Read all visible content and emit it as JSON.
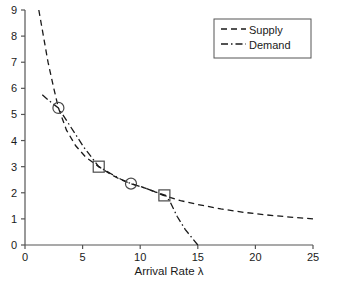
{
  "chart_data": {
    "type": "line",
    "title": "",
    "xlabel": "Arrival Rate λ",
    "ylabel": "",
    "xlim": [
      0,
      25
    ],
    "ylim": [
      0,
      9
    ],
    "xticks": [
      0,
      5,
      10,
      15,
      20,
      25
    ],
    "yticks": [
      0,
      1,
      2,
      3,
      4,
      5,
      6,
      7,
      8,
      9
    ],
    "xtick_labels": [
      "0",
      "5",
      "10",
      "15",
      "20",
      "25"
    ],
    "ytick_labels": [
      "0",
      "1",
      "2",
      "3",
      "4",
      "5",
      "6",
      "7",
      "8",
      "9"
    ],
    "grid": false,
    "legend_position": "upper right",
    "series": [
      {
        "name": "Supply",
        "style": "dashed",
        "color": "#1a1a1a",
        "points": [
          [
            1.2,
            9.0
          ],
          [
            1.6,
            8.0
          ],
          [
            2.0,
            7.0
          ],
          [
            2.5,
            6.0
          ],
          [
            2.9,
            5.25
          ],
          [
            3.6,
            4.4
          ],
          [
            4.4,
            3.8
          ],
          [
            5.3,
            3.35
          ],
          [
            6.4,
            3.0
          ],
          [
            7.4,
            2.72
          ],
          [
            8.3,
            2.5
          ],
          [
            9.2,
            2.35
          ],
          [
            10.3,
            2.2
          ],
          [
            11.2,
            2.05
          ],
          [
            12.0,
            1.9
          ],
          [
            13.5,
            1.7
          ],
          [
            15.0,
            1.55
          ],
          [
            17.0,
            1.38
          ],
          [
            19.0,
            1.25
          ],
          [
            21.0,
            1.15
          ],
          [
            23.0,
            1.07
          ],
          [
            25.0,
            1.0
          ]
        ]
      },
      {
        "name": "Demand",
        "style": "dashdot",
        "color": "#1a1a1a",
        "points": [
          [
            1.5,
            5.75
          ],
          [
            2.3,
            5.45
          ],
          [
            2.9,
            5.25
          ],
          [
            4.0,
            4.5
          ],
          [
            5.1,
            3.75
          ],
          [
            6.4,
            3.0
          ],
          [
            7.5,
            2.72
          ],
          [
            8.4,
            2.5
          ],
          [
            9.2,
            2.35
          ],
          [
            10.3,
            2.2
          ],
          [
            11.2,
            2.05
          ],
          [
            12.2,
            1.9
          ],
          [
            12.6,
            1.65
          ],
          [
            13.2,
            1.1
          ],
          [
            13.9,
            0.6
          ],
          [
            15.0,
            0.0
          ]
        ]
      }
    ],
    "markers": [
      {
        "shape": "circle",
        "x": 2.9,
        "y": 5.25
      },
      {
        "shape": "square",
        "x": 6.4,
        "y": 3.0
      },
      {
        "shape": "circle",
        "x": 9.2,
        "y": 2.35
      },
      {
        "shape": "square",
        "x": 12.1,
        "y": 1.9
      }
    ],
    "legend_entries": [
      {
        "label": "Supply",
        "style": "dashed"
      },
      {
        "label": "Demand",
        "style": "dashdot"
      }
    ]
  },
  "legend": {
    "supply_label": "Supply",
    "demand_label": "Demand"
  },
  "axes": {
    "x_title": "Arrival Rate λ"
  },
  "colors": {
    "line": "#1a1a1a",
    "axis": "#555555",
    "background": "#ffffff"
  }
}
